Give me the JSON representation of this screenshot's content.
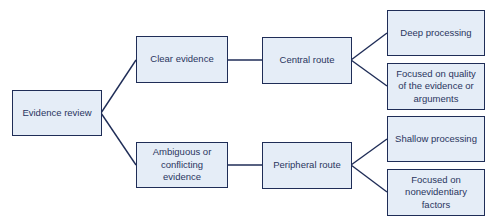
{
  "diagram": {
    "colors": {
      "fill": "#e5edf7",
      "border": "#1f2d57",
      "text": "#2a3560",
      "line": "#1f2d57"
    },
    "nodes": {
      "root": "Evidence review",
      "clear": "Clear evidence",
      "ambiguous": "Ambiguous or conflicting evidence",
      "central": "Central route",
      "peripheral": "Peripheral route",
      "deep": "Deep processing",
      "quality": "Focused on quality of the evidence or arguments",
      "shallow": "Shallow processing",
      "nonevidentiary": "Focused on nonevidentiary factors"
    },
    "edges": [
      [
        "root",
        "clear"
      ],
      [
        "root",
        "ambiguous"
      ],
      [
        "clear",
        "central"
      ],
      [
        "ambiguous",
        "peripheral"
      ],
      [
        "central",
        "deep"
      ],
      [
        "central",
        "quality"
      ],
      [
        "peripheral",
        "shallow"
      ],
      [
        "peripheral",
        "nonevidentiary"
      ]
    ]
  }
}
